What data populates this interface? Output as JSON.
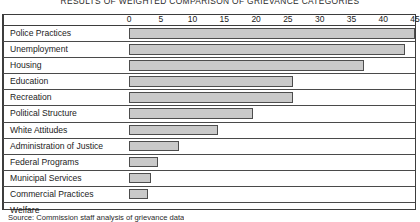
{
  "chart_data": {
    "type": "bar",
    "orientation": "horizontal",
    "title": "RESULTS OF WEIGHTED COMPARISON OF GRIEVANCE CATEGORIES",
    "xlabel": "",
    "ylabel": "",
    "xlim": [
      0,
      45
    ],
    "grid": false,
    "legend": null,
    "tick_labels": [
      "0",
      "5",
      "10",
      "15",
      "20",
      "25",
      "30",
      "35",
      "40",
      "45"
    ],
    "ticks": [
      0,
      5,
      10,
      15,
      20,
      25,
      30,
      35,
      40,
      45
    ],
    "categories": [
      "Police Practices",
      "Unemployment",
      "Housing",
      "Education",
      "Recreation",
      "Political Structure",
      "White Attitudes",
      "Administration of Justice",
      "Federal Programs",
      "Municipal Services",
      "Commercial Practices",
      "Welfare"
    ],
    "values": [
      45,
      43.5,
      37,
      25.8,
      25.8,
      19.5,
      14,
      7.8,
      4.5,
      3.5,
      3,
      0
    ],
    "bar_color": "#c9c9c9",
    "bar_border_color": "#4d4d4d",
    "frame_color": "#3d3d3d"
  },
  "caption": {
    "text": "Source: Commission staff analysis of grievance data"
  }
}
